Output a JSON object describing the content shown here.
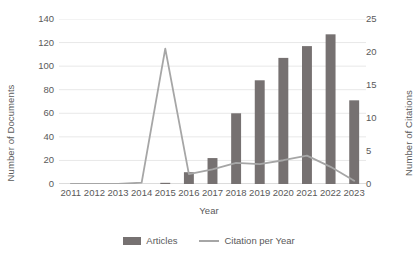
{
  "chart_data": {
    "type": "bar",
    "title": "",
    "xlabel": "Year",
    "ylabel": "Number of Documents",
    "y2label": "Number of Citations",
    "categories": [
      "2011",
      "2012",
      "2013",
      "2014",
      "2015",
      "2016",
      "2017",
      "2018",
      "2019",
      "2020",
      "2021",
      "2022",
      "2023"
    ],
    "series": [
      {
        "name": "Articles",
        "type": "bar",
        "axis": "left",
        "color": "#767171",
        "values": [
          0,
          0,
          0,
          0,
          1,
          10,
          22,
          60,
          88,
          107,
          117,
          127,
          71
        ]
      },
      {
        "name": "Citation per Year",
        "type": "line",
        "axis": "right",
        "color": "#a6a6a6",
        "values": [
          0,
          0,
          0,
          0.2,
          20.5,
          1.5,
          2.2,
          3.2,
          3.0,
          3.6,
          4.3,
          2.6,
          0.5
        ]
      }
    ],
    "ylim": [
      0,
      140
    ],
    "yticks": [
      0,
      20,
      40,
      60,
      80,
      100,
      120,
      140
    ],
    "y2lim": [
      0,
      25
    ],
    "y2ticks": [
      0,
      5,
      10,
      15,
      20,
      25
    ],
    "grid": true,
    "legend_position": "bottom",
    "legend": [
      "Articles",
      "Citation per Year"
    ]
  },
  "axes": {
    "y_left_title": "Number of Documents",
    "y_right_title": "Number of Citations",
    "x_title": "Year"
  },
  "legend": {
    "articles_label": "Articles",
    "citation_label": "Citation per Year"
  }
}
